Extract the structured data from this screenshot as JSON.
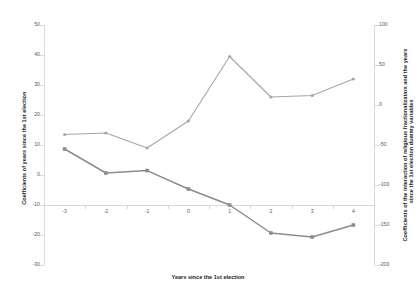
{
  "chart_data": {
    "type": "line",
    "title": "",
    "xlabel": "Years since the 1st election",
    "ylabel": "Coefficients of years since the 1st election",
    "y2label": "Coefficients of the interaction of religious fractionalization and the years since the 1st election dummy variables",
    "categories": [
      "-3",
      "-2",
      "-1",
      "0",
      "1",
      "2",
      "3",
      "4"
    ],
    "xlim": [
      -3,
      4
    ],
    "ylim": [
      -30,
      50
    ],
    "y2lim": [
      -200,
      100
    ],
    "yticks": [
      "50",
      "40",
      "30",
      "20",
      "10",
      "0",
      "-10",
      "-20",
      "-30"
    ],
    "ytick_values": [
      50,
      40,
      30,
      20,
      10,
      0,
      -10,
      -20,
      -30
    ],
    "y2ticks": [
      "100",
      "50",
      "0",
      "-50",
      "-100",
      "-150",
      "-200"
    ],
    "y2tick_values": [
      100,
      50,
      0,
      -50,
      -100,
      -150,
      -200
    ],
    "grid": false,
    "legend": "none",
    "series": [
      {
        "name": "Coefficients of years since the 1st election",
        "axis": "left",
        "marker": "circle",
        "color": "#a6a6a6",
        "values": [
          13.5,
          14.0,
          9.0,
          18.0,
          39.5,
          26.0,
          26.5,
          32.0
        ]
      },
      {
        "name": "Coefficients of the interaction of religious fractionalization and the years since the 1st election dummy variables",
        "axis": "right",
        "marker": "square",
        "color": "#8c8c8c",
        "values": [
          -55,
          -85,
          -82,
          -105,
          -125,
          -160,
          -165,
          -150
        ]
      }
    ]
  },
  "colors": {
    "series1": "#a6a6a6",
    "series2": "#8c8c8c",
    "axis": "#d9d9d9",
    "tick_text": "#595959",
    "title_text": "#1a1a1a",
    "background": "#ffffff"
  }
}
